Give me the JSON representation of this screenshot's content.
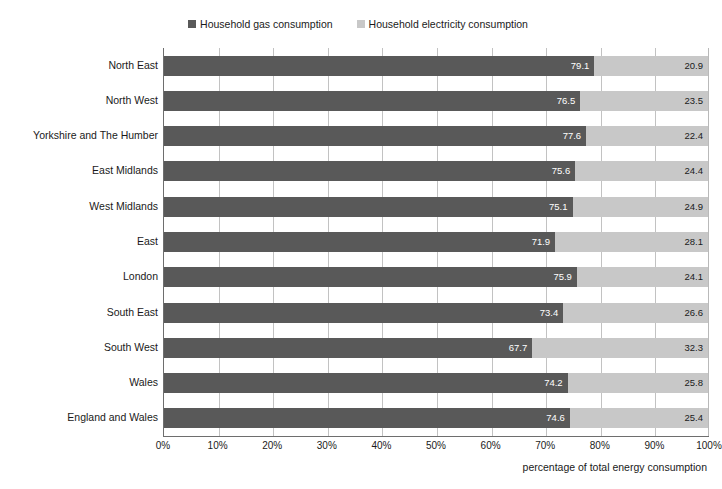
{
  "chart_data": {
    "type": "bar",
    "orientation": "horizontal",
    "stacked": true,
    "title": "",
    "xlabel": "percentage of total energy consumption",
    "ylabel": "",
    "xlim": [
      0,
      100
    ],
    "xticks": [
      "0%",
      "10%",
      "20%",
      "30%",
      "40%",
      "50%",
      "60%",
      "70%",
      "80%",
      "90%",
      "100%"
    ],
    "xtick_values": [
      0,
      10,
      20,
      30,
      40,
      50,
      60,
      70,
      80,
      90,
      100
    ],
    "grid": true,
    "legend_position": "top-center",
    "categories": [
      "North East",
      "North West",
      "Yorkshire and The Humber",
      "East Midlands",
      "West Midlands",
      "East",
      "London",
      "South East",
      "South West",
      "Wales",
      "England and Wales"
    ],
    "series": [
      {
        "name": "Household gas consumption",
        "color": "#595959",
        "values": [
          79.1,
          76.5,
          77.6,
          75.6,
          75.1,
          71.9,
          75.9,
          73.4,
          67.7,
          74.2,
          74.6
        ],
        "labels": [
          "79.1",
          "76.5",
          "77.6",
          "75.6",
          "75.1",
          "71.9",
          "75.9",
          "73.4",
          "67.7",
          "74.2",
          "74.6"
        ]
      },
      {
        "name": "Household electricity consumption",
        "color": "#c8c8c8",
        "values": [
          20.9,
          23.5,
          22.4,
          24.4,
          24.9,
          28.1,
          24.1,
          26.6,
          32.3,
          25.8,
          25.4
        ],
        "labels": [
          "20.9",
          "23.5",
          "22.4",
          "24.4",
          "24.9",
          "28.1",
          "24.1",
          "26.6",
          "32.3",
          "25.8",
          "25.4"
        ]
      }
    ]
  }
}
